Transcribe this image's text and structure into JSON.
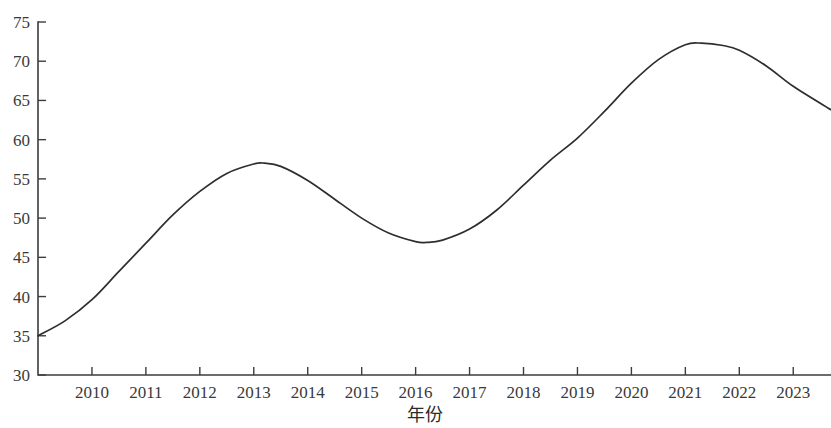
{
  "chart_data": {
    "type": "line",
    "title": "",
    "subtitle": "",
    "xlabel": "年份",
    "ylabel": "",
    "grid": false,
    "legend": null,
    "legend_position": "none",
    "line_color": "#2e2e2e",
    "background_color": "#ffffff",
    "axis_color": "#3d3d3d",
    "text_color": "#3a3a3a",
    "xlim": [
      2009.0,
      2023.7
    ],
    "ylim": [
      30,
      75
    ],
    "y_ticks": [
      30,
      35,
      40,
      45,
      50,
      55,
      60,
      65,
      70,
      75
    ],
    "x_ticks": [
      2010,
      2011,
      2012,
      2013,
      2014,
      2015,
      2016,
      2017,
      2018,
      2019,
      2020,
      2021,
      2022,
      2023
    ],
    "x_tick_labels": [
      "2010",
      "2011",
      "2012",
      "2013",
      "2014",
      "2015",
      "2016",
      "2017",
      "2018",
      "2019",
      "2020",
      "2021",
      "2022",
      "2023"
    ],
    "y_tick_labels": [
      "30",
      "35",
      "40",
      "45",
      "50",
      "55",
      "60",
      "65",
      "70",
      "75"
    ],
    "series": [
      {
        "name": "",
        "x": [
          2009.0,
          2009.5,
          2010.0,
          2010.5,
          2011.0,
          2011.5,
          2012.0,
          2012.5,
          2013.0,
          2013.2,
          2013.5,
          2014.0,
          2014.5,
          2015.0,
          2015.5,
          2016.0,
          2016.2,
          2016.5,
          2017.0,
          2017.5,
          2018.0,
          2018.5,
          2019.0,
          2019.5,
          2020.0,
          2020.5,
          2021.0,
          2021.3,
          2021.7,
          2022.0,
          2022.5,
          2023.0,
          2023.7
        ],
        "y": [
          35.0,
          36.9,
          39.6,
          43.2,
          46.8,
          50.4,
          53.4,
          55.7,
          56.9,
          57.0,
          56.6,
          54.8,
          52.4,
          50.0,
          48.1,
          47.0,
          46.9,
          47.2,
          48.6,
          51.0,
          54.2,
          57.4,
          60.2,
          63.6,
          67.2,
          70.2,
          72.1,
          72.3,
          72.0,
          71.4,
          69.4,
          66.8,
          63.8
        ]
      }
    ],
    "annotations": [],
    "notable_points": {
      "start": {
        "x": 2009.0,
        "y": 35.0
      },
      "local_max_1": {
        "x": 2013.2,
        "y": 57.0
      },
      "local_min": {
        "x": 2016.2,
        "y": 46.9
      },
      "global_max": {
        "x": 2021.3,
        "y": 72.3
      },
      "end": {
        "x": 2023.7,
        "y": 63.8
      }
    }
  }
}
